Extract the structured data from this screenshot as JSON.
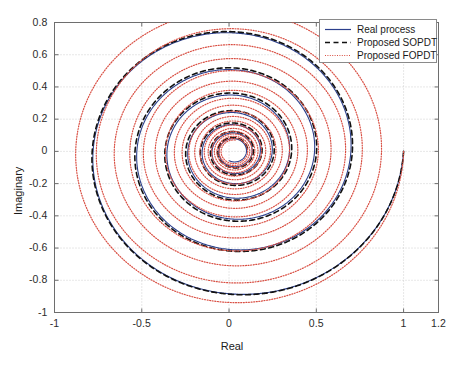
{
  "chart_data": {
    "type": "line",
    "title": "",
    "xlabel": "Real",
    "ylabel": "Imaginary",
    "xlim": [
      -1,
      1.2
    ],
    "ylim": [
      -1,
      0.8
    ],
    "xticks": [
      "-1",
      "-0.5",
      "0",
      "0.5",
      "1",
      "1.2"
    ],
    "xtick_values": [
      -1,
      -0.5,
      0,
      0.5,
      1,
      1.2
    ],
    "yticks": [
      "-1",
      "-0.8",
      "-0.6",
      "-0.4",
      "-0.2",
      "0",
      "0.2",
      "0.4",
      "0.6",
      "0.8"
    ],
    "ytick_values": [
      -1,
      -0.8,
      -0.6,
      -0.4,
      -0.2,
      0,
      0.2,
      0.4,
      0.6,
      0.8
    ],
    "grid": true,
    "grid_style": "dotted",
    "legend_position": "top-right",
    "plot_description": "Nyquist plot showing three inward spiralling curves starting at (1, 0) and converging near (0.03, 0)",
    "series": [
      {
        "name": "Real process",
        "style": "solid",
        "color": "#2b3f8c",
        "start_point": [
          1,
          0
        ],
        "end_point": [
          0.03,
          0.0
        ],
        "extrema": {
          "min_imag": -0.94,
          "max_imag": 0.375,
          "min_real": -0.715,
          "max_real": 1.0
        },
        "spiral": {
          "k": 1.0,
          "a": 0.6,
          "theta_max": 46.0,
          "phase_gain": 1.0,
          "center": [
            0.028,
            0.0
          ]
        }
      },
      {
        "name": "Proposed SOPDT",
        "style": "dashed",
        "color": "#111111",
        "start_point": [
          1,
          0
        ],
        "end_point": [
          0.03,
          0.0
        ],
        "extrema": {
          "min_imag": -0.945,
          "max_imag": 0.375,
          "min_real": -0.72,
          "max_real": 1.0
        },
        "spiral": {
          "k": 1.0,
          "a": 0.58,
          "theta_max": 46.0,
          "phase_gain": 0.955,
          "center": [
            0.028,
            0.0
          ]
        }
      },
      {
        "name": "Proposed FOPDT",
        "style": "dotted",
        "color": "#d94f43",
        "start_point": [
          1,
          0
        ],
        "end_point": [
          0.03,
          0.0
        ],
        "extrema": {
          "min_imag": -0.94,
          "max_imag": 0.62,
          "min_real": -0.78,
          "max_real": 1.0
        },
        "spiral": {
          "k": 1.0,
          "a": 0.225,
          "theta_max": 118.0,
          "phase_gain": 1.0,
          "center": [
            0.028,
            0.0
          ]
        }
      }
    ]
  },
  "legend": {
    "items": [
      {
        "label": "Real process",
        "style": "solid",
        "color": "#2b3f8c"
      },
      {
        "label": "Proposed SOPDT",
        "style": "dashed",
        "color": "#111111"
      },
      {
        "label": "Proposed FOPDT",
        "style": "dotted",
        "color": "#d94f43"
      }
    ]
  },
  "axes": {
    "x_title": "Real",
    "y_title": "Imaginary"
  }
}
